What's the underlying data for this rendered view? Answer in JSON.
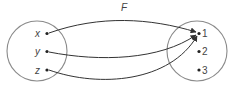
{
  "diagram": {
    "title": "F",
    "domain_set": {
      "elements": [
        {
          "label": "x"
        },
        {
          "label": "y"
        },
        {
          "label": "z"
        }
      ]
    },
    "codomain_set": {
      "elements": [
        {
          "label": "1"
        },
        {
          "label": "2"
        },
        {
          "label": "3"
        }
      ]
    },
    "mappings": [
      {
        "from": "x",
        "to": "1"
      },
      {
        "from": "y",
        "to": "1"
      },
      {
        "from": "z",
        "to": "1"
      }
    ],
    "colors": {
      "circle": "#8a8a8a",
      "arrow": "#333333",
      "text": "#444444"
    }
  }
}
